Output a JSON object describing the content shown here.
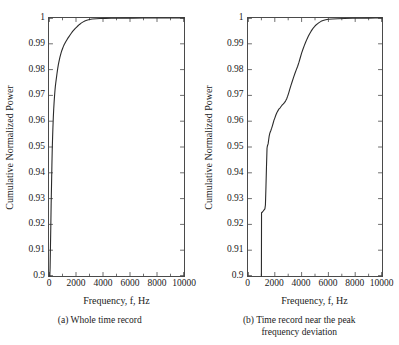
{
  "figure": {
    "background": "#ffffff",
    "line_color": "#2b2b2b",
    "axis_color": "#4a4a4a"
  },
  "chart_data": [
    {
      "type": "line",
      "panel_id": "a",
      "title": "(a) Whole time record",
      "xlabel": "Frequency, f, Hz",
      "ylabel": "Cumulative Normalized Power",
      "xlim": [
        0,
        10000
      ],
      "ylim": [
        0.9,
        1
      ],
      "xticks": [
        0,
        2000,
        4000,
        6000,
        8000,
        10000
      ],
      "xticklabels": [
        "0",
        "2000",
        "4000",
        "6000",
        "8000",
        "10000"
      ],
      "yticks": [
        0.9,
        0.91,
        0.92,
        0.93,
        0.94,
        0.95,
        0.96,
        0.97,
        0.98,
        0.99,
        1
      ],
      "yticklabels": [
        "0.9",
        "0.91",
        "0.92",
        "0.93",
        "0.94",
        "0.95",
        "0.96",
        "0.97",
        "0.98",
        "0.99",
        "1"
      ],
      "grid": false,
      "legend": null,
      "tick_direction": "in",
      "series": [
        {
          "name": "Cumulative normalized power (whole record)",
          "x": [
            60,
            80,
            100,
            130,
            160,
            190,
            215,
            240,
            265,
            290,
            320,
            350,
            380,
            410,
            440,
            470,
            500,
            530,
            560,
            590,
            620,
            650,
            690,
            730,
            770,
            810,
            850,
            900,
            950,
            1000,
            1060,
            1120,
            1180,
            1250,
            1320,
            1400,
            1480,
            1560,
            1650,
            1750,
            1850,
            1950,
            2050,
            2150,
            2260,
            2380,
            2500,
            2650,
            2800,
            3000,
            3200,
            3500,
            3800,
            4200,
            4600,
            5000,
            5600,
            6200,
            7000,
            8000,
            9000,
            10000
          ],
          "y": [
            0.9,
            0.903,
            0.909,
            0.918,
            0.928,
            0.936,
            0.943,
            0.949,
            0.9535,
            0.9575,
            0.9615,
            0.9648,
            0.9675,
            0.9698,
            0.9718,
            0.9735,
            0.9748,
            0.976,
            0.9772,
            0.9784,
            0.9795,
            0.9806,
            0.9818,
            0.9829,
            0.9839,
            0.9848,
            0.9856,
            0.9866,
            0.9874,
            0.9881,
            0.9889,
            0.9896,
            0.9902,
            0.9909,
            0.9915,
            0.9922,
            0.9928,
            0.9934,
            0.9941,
            0.9948,
            0.9954,
            0.996,
            0.9965,
            0.997,
            0.9975,
            0.998,
            0.9984,
            0.9988,
            0.9991,
            0.9994,
            0.9996,
            0.9997,
            0.9998,
            0.99985,
            0.9999,
            0.99992,
            0.99995,
            0.99996,
            0.99998,
            0.99999,
            1.0,
            1.0
          ]
        }
      ]
    },
    {
      "type": "line",
      "panel_id": "b",
      "title": "(b) Time record near the peak frequency deviation",
      "xlabel": "Frequency, f, Hz",
      "ylabel": "Cumulative Normalized Power",
      "xlim": [
        0,
        10000
      ],
      "ylim": [
        0.9,
        1
      ],
      "xticks": [
        0,
        2000,
        4000,
        6000,
        8000,
        10000
      ],
      "xticklabels": [
        "0",
        "2000",
        "4000",
        "6000",
        "8000",
        "10000"
      ],
      "yticks": [
        0.9,
        0.91,
        0.92,
        0.93,
        0.94,
        0.95,
        0.96,
        0.97,
        0.98,
        0.99,
        1
      ],
      "yticklabels": [
        "0.9",
        "0.91",
        "0.92",
        "0.93",
        "0.94",
        "0.95",
        "0.96",
        "0.97",
        "0.98",
        "0.99",
        "1"
      ],
      "grid": false,
      "legend": null,
      "tick_direction": "in",
      "series": [
        {
          "name": "Cumulative normalized power (near peak frequency deviation)",
          "x": [
            1000,
            1010,
            1080,
            1140,
            1200,
            1260,
            1300,
            1340,
            1380,
            1420,
            1440,
            1460,
            1500,
            1540,
            1580,
            1620,
            1660,
            1700,
            1760,
            1820,
            1880,
            1940,
            2000,
            2080,
            2160,
            2240,
            2320,
            2400,
            2480,
            2560,
            2640,
            2720,
            2800,
            2880,
            2960,
            3040,
            3120,
            3200,
            3300,
            3400,
            3500,
            3600,
            3700,
            3800,
            3900,
            4000,
            4100,
            4200,
            4300,
            4400,
            4500,
            4600,
            4700,
            4800,
            4900,
            5000,
            5100,
            5200,
            5300,
            5450,
            5600,
            5800,
            6000,
            6300,
            6700,
            7200,
            7800,
            8400,
            9000,
            9500,
            10000
          ],
          "y": [
            0.9,
            0.9245,
            0.9248,
            0.9252,
            0.9256,
            0.926,
            0.9275,
            0.9345,
            0.9425,
            0.9495,
            0.9502,
            0.9506,
            0.9512,
            0.9527,
            0.9542,
            0.9552,
            0.9558,
            0.9563,
            0.9572,
            0.9582,
            0.9593,
            0.9604,
            0.9612,
            0.9624,
            0.9634,
            0.9641,
            0.9648,
            0.9652,
            0.9658,
            0.9663,
            0.9667,
            0.9672,
            0.9678,
            0.9686,
            0.9697,
            0.971,
            0.9724,
            0.9738,
            0.9754,
            0.977,
            0.9785,
            0.9799,
            0.9812,
            0.9828,
            0.9846,
            0.9864,
            0.9879,
            0.9893,
            0.9906,
            0.9918,
            0.9929,
            0.9939,
            0.9948,
            0.9956,
            0.9963,
            0.9969,
            0.9974,
            0.9978,
            0.9982,
            0.9987,
            0.999,
            0.9993,
            0.9995,
            0.9996,
            0.99972,
            0.99981,
            0.99988,
            0.99993,
            0.99996,
            0.99998,
            1.0
          ]
        }
      ]
    }
  ],
  "panels": [
    {
      "id": "a",
      "caption": "(a) Whole time record",
      "xlabel": "Frequency, f, Hz",
      "ylabel": "Cumulative Normalized Power",
      "xticklabels": [
        "0",
        "2000",
        "4000",
        "6000",
        "8000",
        "10000"
      ],
      "yticklabels": [
        "0.9",
        "0.91",
        "0.92",
        "0.93",
        "0.94",
        "0.95",
        "0.96",
        "0.97",
        "0.98",
        "0.99",
        "1"
      ]
    },
    {
      "id": "b",
      "caption_line1": "(b) Time record near the peak",
      "caption_line2": "frequency deviation",
      "xlabel": "Frequency, f, Hz",
      "ylabel": "Cumulative Normalized Power",
      "xticklabels": [
        "0",
        "2000",
        "4000",
        "6000",
        "8000",
        "10000"
      ],
      "yticklabels": [
        "0.9",
        "0.91",
        "0.92",
        "0.93",
        "0.94",
        "0.95",
        "0.96",
        "0.97",
        "0.98",
        "0.99",
        "1"
      ]
    }
  ]
}
